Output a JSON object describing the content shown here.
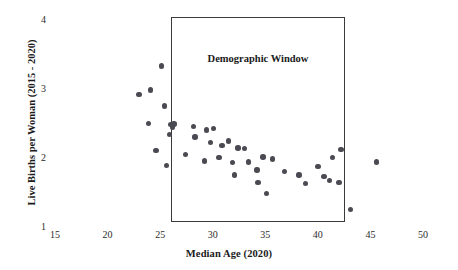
{
  "chart_data": {
    "type": "scatter",
    "title": "",
    "xlabel": "Median Age (2020)",
    "ylabel": "Live Births per Woman (2015 - 2020)",
    "xlim": [
      15,
      50
    ],
    "ylim": [
      1,
      4
    ],
    "xticks": [
      15,
      20,
      25,
      30,
      35,
      40,
      45,
      50
    ],
    "yticks": [
      1,
      2,
      3,
      4
    ],
    "grid": false,
    "legend": null,
    "annotations": [
      {
        "name": "demographic-window",
        "label": "Demographic Window",
        "x_range": [
          26.0,
          42.6
        ],
        "y_range": [
          1.06,
          4.03
        ]
      }
    ],
    "points": [
      {
        "x": 25.1,
        "y": 3.32
      },
      {
        "x": 23.0,
        "y": 2.91
      },
      {
        "x": 24.1,
        "y": 2.97
      },
      {
        "x": 25.4,
        "y": 2.74
      },
      {
        "x": 23.9,
        "y": 2.49
      },
      {
        "x": 26.0,
        "y": 2.47
      },
      {
        "x": 26.2,
        "y": 2.43
      },
      {
        "x": 26.3,
        "y": 2.48
      },
      {
        "x": 25.9,
        "y": 2.33
      },
      {
        "x": 24.6,
        "y": 2.09
      },
      {
        "x": 28.2,
        "y": 2.44
      },
      {
        "x": 28.3,
        "y": 2.29
      },
      {
        "x": 29.4,
        "y": 2.39
      },
      {
        "x": 30.1,
        "y": 2.41
      },
      {
        "x": 29.8,
        "y": 2.21
      },
      {
        "x": 27.4,
        "y": 2.04
      },
      {
        "x": 25.6,
        "y": 1.88
      },
      {
        "x": 30.9,
        "y": 2.17
      },
      {
        "x": 31.5,
        "y": 2.23
      },
      {
        "x": 30.6,
        "y": 1.99
      },
      {
        "x": 29.2,
        "y": 1.94
      },
      {
        "x": 31.9,
        "y": 1.92
      },
      {
        "x": 32.4,
        "y": 2.13
      },
      {
        "x": 33.0,
        "y": 2.12
      },
      {
        "x": 33.4,
        "y": 1.93
      },
      {
        "x": 32.1,
        "y": 1.74
      },
      {
        "x": 34.2,
        "y": 1.81
      },
      {
        "x": 34.8,
        "y": 2.0
      },
      {
        "x": 35.7,
        "y": 1.97
      },
      {
        "x": 34.3,
        "y": 1.63
      },
      {
        "x": 35.1,
        "y": 1.47
      },
      {
        "x": 36.8,
        "y": 1.79
      },
      {
        "x": 38.2,
        "y": 1.74
      },
      {
        "x": 38.8,
        "y": 1.62
      },
      {
        "x": 40.0,
        "y": 1.86
      },
      {
        "x": 40.6,
        "y": 1.72
      },
      {
        "x": 41.4,
        "y": 1.99
      },
      {
        "x": 41.1,
        "y": 1.66
      },
      {
        "x": 42.2,
        "y": 2.11
      },
      {
        "x": 42.0,
        "y": 1.63
      },
      {
        "x": 43.1,
        "y": 1.24
      },
      {
        "x": 45.6,
        "y": 1.93
      }
    ]
  }
}
